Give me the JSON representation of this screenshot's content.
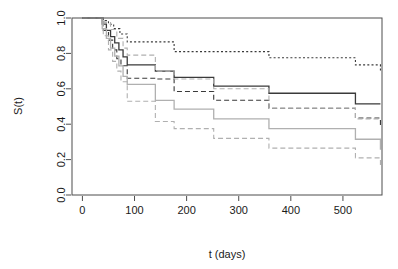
{
  "chart_data": {
    "type": "line",
    "title": "",
    "subtitle": "",
    "xlabel": "t (days)",
    "ylabel": "S(t)",
    "xlim": [
      -20,
      575
    ],
    "ylim": [
      0.0,
      1.0
    ],
    "xticks": [
      0,
      100,
      200,
      300,
      400,
      500
    ],
    "xtick_labels": [
      "0",
      "100",
      "200",
      "300",
      "400",
      "500"
    ],
    "yticks": [
      0.0,
      0.2,
      0.4,
      0.6,
      0.8,
      1.0
    ],
    "ytick_labels": [
      "0.0",
      "0.2",
      "0.4",
      "0.6",
      "0.8",
      "1.0"
    ],
    "grid": false,
    "legend": "none",
    "step_style": "post",
    "colors": {
      "group1": "#3a3a3a",
      "group2": "#b0b0b0",
      "axis": "#4d4d4d",
      "background": "#ffffff"
    },
    "series": [
      {
        "name": "Group 1 survival estimate",
        "role": "estimate",
        "group": "group1",
        "color": "#3a3a3a",
        "dash": "none",
        "width": 1.3,
        "x": [
          0,
          30,
          38,
          46,
          54,
          62,
          70,
          78,
          86,
          140,
          176,
          252,
          358,
          524,
          572
        ],
        "y": [
          1.0,
          1.0,
          0.965,
          0.93,
          0.895,
          0.86,
          0.82,
          0.78,
          0.735,
          0.7,
          0.665,
          0.615,
          0.575,
          0.515,
          0.515
        ]
      },
      {
        "name": "Group 1 upper confidence limit",
        "role": "upper-ci",
        "group": "group1",
        "color": "#3a3a3a",
        "dash": "dotted",
        "width": 1.1,
        "x": [
          0,
          30,
          40,
          50,
          60,
          72,
          86,
          140,
          176,
          252,
          358,
          524,
          572
        ],
        "y": [
          1.0,
          1.0,
          0.985,
          0.965,
          0.94,
          0.91,
          0.865,
          0.865,
          0.81,
          0.81,
          0.775,
          0.735,
          0.69
        ]
      },
      {
        "name": "Group 1 lower confidence limit",
        "role": "lower-ci",
        "group": "group1",
        "color": "#3a3a3a",
        "dash": "dashed",
        "width": 1.1,
        "x": [
          0,
          30,
          40,
          50,
          58,
          66,
          74,
          86,
          140,
          176,
          252,
          358,
          524,
          572
        ],
        "y": [
          1.0,
          1.0,
          0.93,
          0.875,
          0.82,
          0.77,
          0.73,
          0.66,
          0.655,
          0.585,
          0.535,
          0.49,
          0.435,
          0.38
        ]
      },
      {
        "name": "Group 2 survival estimate",
        "role": "estimate",
        "group": "group2",
        "color": "#b0b0b0",
        "dash": "none",
        "width": 1.3,
        "x": [
          0,
          30,
          38,
          46,
          54,
          62,
          70,
          78,
          86,
          140,
          176,
          252,
          358,
          524,
          572
        ],
        "y": [
          1.0,
          1.0,
          0.94,
          0.885,
          0.83,
          0.785,
          0.73,
          0.67,
          0.625,
          0.535,
          0.485,
          0.43,
          0.375,
          0.315,
          0.255
        ]
      },
      {
        "name": "Group 2 upper confidence limit",
        "role": "upper-ci",
        "group": "group2",
        "color": "#b0b0b0",
        "dash": "dashed",
        "width": 1.1,
        "x": [
          0,
          30,
          42,
          54,
          66,
          78,
          86,
          140,
          176,
          252,
          358,
          524,
          572
        ],
        "y": [
          1.0,
          1.0,
          0.975,
          0.935,
          0.885,
          0.83,
          0.79,
          0.7,
          0.655,
          0.6,
          0.49,
          0.43,
          0.43
        ]
      },
      {
        "name": "Group 2 lower confidence limit",
        "role": "lower-ci",
        "group": "group2",
        "color": "#b0b0b0",
        "dash": "dashed",
        "width": 1.1,
        "x": [
          0,
          30,
          40,
          50,
          58,
          66,
          74,
          86,
          140,
          176,
          252,
          358,
          524,
          572
        ],
        "y": [
          1.0,
          1.0,
          0.9,
          0.82,
          0.755,
          0.7,
          0.64,
          0.53,
          0.415,
          0.375,
          0.32,
          0.265,
          0.21,
          0.16
        ]
      }
    ]
  }
}
